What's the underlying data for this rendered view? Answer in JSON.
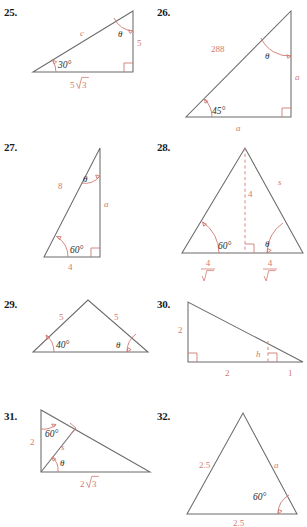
{
  "page": {
    "accent_color": "#cf7b72",
    "line_color": "#6b6b6b",
    "text_color": "#1a1a1a"
  },
  "problems": [
    {
      "number": "25.",
      "shape": "right-triangle",
      "labels": {
        "hypotenuse": "c",
        "vertical_leg": "5",
        "base": "5√3",
        "angle_bottom_left": "30°",
        "angle_top": "θ"
      },
      "base_value": "5",
      "base_radical": "3",
      "right_angle": true
    },
    {
      "number": "26.",
      "shape": "right-triangle",
      "labels": {
        "hypotenuse": "288",
        "vertical_leg": "a",
        "base": "a",
        "angle_bottom_left": "45°",
        "angle_top": "θ"
      },
      "right_angle": true
    },
    {
      "number": "27.",
      "shape": "right-triangle",
      "labels": {
        "hypotenuse": "8",
        "vertical_leg": "a",
        "base": "4",
        "angle_bottom_left": "60°",
        "angle_top": "θ"
      },
      "right_angle": true
    },
    {
      "number": "28.",
      "shape": "isosceles-triangle-with-altitude",
      "labels": {
        "altitude": "4",
        "right_side": "s",
        "angle_left": "60°",
        "angle_right": "θ",
        "base_left_num": "4",
        "base_left_den": "√3",
        "base_right_num": "4",
        "base_right_den": "√3"
      },
      "right_angle": true
    },
    {
      "number": "29.",
      "shape": "isosceles-triangle",
      "labels": {
        "left_side": "5",
        "right_side": "5",
        "angle_left": "40°",
        "angle_right": "θ"
      },
      "right_angle": false
    },
    {
      "number": "30.",
      "shape": "right-triangle-with-inner-height",
      "labels": {
        "vertical_leg": "2",
        "base_left": "2",
        "base_right": "1",
        "height": "h"
      },
      "right_angle": true
    },
    {
      "number": "31.",
      "shape": "right-triangle-with-cevian",
      "labels": {
        "vertical_leg": "2",
        "cevian": "s",
        "base": "2√3",
        "angle_top": "60°",
        "angle_bottom": "θ"
      },
      "base_value": "2",
      "base_radical": "3",
      "right_angle": true
    },
    {
      "number": "32.",
      "shape": "triangle",
      "labels": {
        "left_side": "2.5",
        "right_side": "a",
        "base": "2.5",
        "angle_right": "60°"
      },
      "right_angle": false
    }
  ]
}
